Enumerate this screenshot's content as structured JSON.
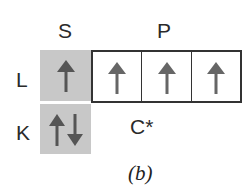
{
  "diagram": {
    "subshell_labels": {
      "s": "S",
      "p": "P"
    },
    "shell_labels": {
      "l": "L",
      "k": "K"
    },
    "orbitals": {
      "L_s": {
        "electrons": [
          "up"
        ]
      },
      "L_p": [
        {
          "electrons": [
            "up"
          ]
        },
        {
          "electrons": [
            "up"
          ]
        },
        {
          "electrons": [
            "up"
          ]
        }
      ],
      "K_s": {
        "electrons": [
          "up",
          "down"
        ]
      }
    },
    "atom_label": "C*",
    "caption": "(b)",
    "colors": {
      "filled_box": "#c8c8c8",
      "arrow": "#555555",
      "border": "#333333"
    }
  }
}
